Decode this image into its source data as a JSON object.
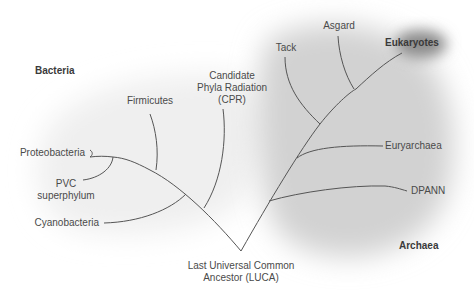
{
  "diagram": {
    "type": "phylogenetic-tree",
    "domains": [
      {
        "id": "bacteria",
        "label": "Bacteria"
      },
      {
        "id": "archaea",
        "label": "Archaea"
      },
      {
        "id": "eukaryotes",
        "label": "Eukaryotes"
      }
    ],
    "root": {
      "label_line1": "Last Universal Common",
      "label_line2": "Ancestor (LUCA)"
    },
    "bacteria_leaves": {
      "proteobacteria": "Proteobacteria",
      "pvc_line1": "PVC",
      "pvc_line2": "superphylum",
      "cyanobacteria": "Cyanobacteria",
      "firmicutes": "Firmicutes",
      "cpr_line1": "Candidate",
      "cpr_line2": "Phyla Radiation",
      "cpr_line3": "(CPR)"
    },
    "archaea_leaves": {
      "tack": "Tack",
      "asgard": "Asgard",
      "euryarchaea": "Euryarchaea",
      "dpann": "DPANN"
    },
    "colors": {
      "line": "#555555",
      "text": "#4a4a4a",
      "archaea_shade": "#cfcfcf",
      "bacteria_shade": "#f0f0f0",
      "eukaryote_shade": "#8a8a8a"
    }
  }
}
